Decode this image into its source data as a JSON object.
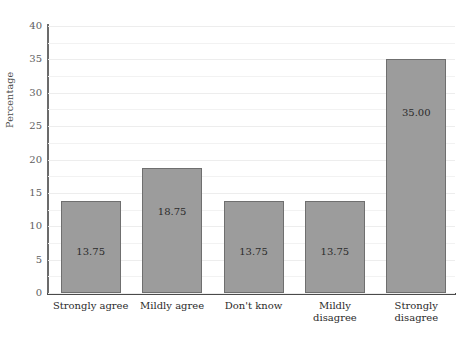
{
  "chart_data": {
    "type": "bar",
    "title": "",
    "subtitle": "",
    "xlabel": "",
    "ylabel": "Percentage",
    "categories": [
      "Strongly agree",
      "Mildly agree",
      "Don't know",
      "Mildly disagree",
      "Strongly disagree"
    ],
    "category_lines": [
      [
        "Strongly agree"
      ],
      [
        "Mildly agree"
      ],
      [
        "Don't know"
      ],
      [
        "Mildly",
        "disagree"
      ],
      [
        "Strongly",
        "disagree"
      ]
    ],
    "values": [
      13.75,
      18.75,
      13.75,
      13.75,
      35.0
    ],
    "value_labels": [
      "13.75",
      "18.75",
      "13.75",
      "13.75",
      "35.00"
    ],
    "ylim": [
      0,
      40
    ],
    "y_ticks": [
      0,
      5,
      10,
      15,
      20,
      25,
      30,
      35,
      40
    ],
    "y_tick_labels": [
      "0",
      "5",
      "10",
      "15",
      "20",
      "25",
      "30",
      "35",
      "40"
    ],
    "minor_gridline_step": 2.5,
    "grid": true,
    "legend": null,
    "legend_position": "none",
    "bar_color": "#9c9c9c",
    "bar_border_color": "#6f6f6f",
    "gridline_color": "#f2f2f2",
    "axis_color": "#4a4a4a",
    "label_color": "#2b2b2b"
  }
}
